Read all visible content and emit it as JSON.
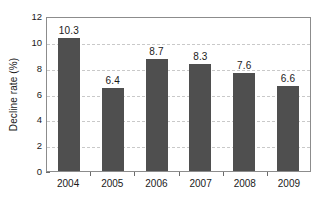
{
  "chart_data": {
    "type": "bar",
    "title": "",
    "subtitle": "",
    "xlabel": "",
    "ylabel": "Decline rate (%)",
    "categories": [
      "2004",
      "2005",
      "2006",
      "2007",
      "2008",
      "2009"
    ],
    "values": [
      10.3,
      6.4,
      8.7,
      8.3,
      7.6,
      6.6
    ],
    "value_labels": [
      "10.3",
      "6.4",
      "8.7",
      "8.3",
      "7.6",
      "6.6"
    ],
    "ylim": [
      0,
      12
    ],
    "ytick_values": [
      0,
      2,
      4,
      6,
      8,
      10,
      12
    ],
    "ytick_labels": [
      "0",
      "2",
      "4",
      "6",
      "8",
      "10",
      "12"
    ],
    "grid": "horizontal-dashed",
    "legend": "none",
    "series": [
      {
        "name": "Decline rate",
        "values": [
          10.3,
          6.4,
          8.7,
          8.3,
          7.6,
          6.6
        ]
      }
    ],
    "colors": {
      "bar": "#4f4f4f",
      "gridline": "#c9c9c9",
      "frame": "#8c8c8c",
      "text": "#1a1a1a",
      "background": "#ffffff"
    }
  }
}
